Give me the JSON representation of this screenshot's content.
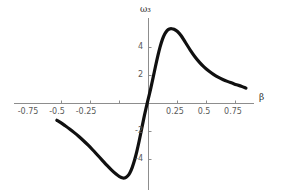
{
  "chart_data": {
    "type": "line",
    "title": "",
    "xlabel": "β",
    "ylabel": "ω3",
    "ylabel_display": "ω₃",
    "xlim": [
      -0.875,
      0.9
    ],
    "ylim": [
      -6.0,
      6.2
    ],
    "grid": false,
    "legend": null,
    "xticks": [
      -0.75,
      -0.5,
      -0.25,
      0.25,
      0.5,
      0.75
    ],
    "xticklabels": [
      "-0.75",
      "-0.5",
      "-0.25",
      "0.25",
      "0.5",
      "0.75"
    ],
    "yticks": [
      4,
      2,
      -2,
      -4
    ],
    "yticklabels": [
      "4",
      "2",
      "-2",
      "-4"
    ],
    "series": [
      {
        "name": "ω3(β)",
        "color": "#101010",
        "linewidth": 3.2,
        "x": [
          -0.79,
          -0.76,
          -0.72,
          -0.68,
          -0.64,
          -0.6,
          -0.56,
          -0.52,
          -0.48,
          -0.44,
          -0.4,
          -0.36,
          -0.32,
          -0.28,
          -0.25,
          -0.22,
          -0.2,
          -0.18,
          -0.16,
          -0.14,
          -0.12,
          -0.1,
          -0.08,
          -0.06,
          -0.04,
          -0.02,
          0.0,
          0.02,
          0.04,
          0.06,
          0.08,
          0.1,
          0.12,
          0.14,
          0.16,
          0.18,
          0.2,
          0.22,
          0.25,
          0.28,
          0.32,
          0.36,
          0.4,
          0.44,
          0.48,
          0.52,
          0.56,
          0.6,
          0.64,
          0.68,
          0.72,
          0.76,
          0.8,
          0.84
        ],
        "y": [
          -1.2,
          -1.35,
          -1.58,
          -1.82,
          -2.08,
          -2.36,
          -2.66,
          -2.98,
          -3.32,
          -3.68,
          -4.04,
          -4.4,
          -4.74,
          -5.04,
          -5.22,
          -5.32,
          -5.3,
          -5.18,
          -4.94,
          -4.56,
          -4.04,
          -3.4,
          -2.66,
          -1.86,
          -1.04,
          -0.3,
          0.4,
          1.1,
          1.86,
          2.64,
          3.38,
          4.04,
          4.58,
          4.96,
          5.2,
          5.32,
          5.34,
          5.3,
          5.14,
          4.86,
          4.34,
          3.82,
          3.34,
          2.94,
          2.6,
          2.32,
          2.08,
          1.88,
          1.72,
          1.58,
          1.46,
          1.34,
          1.24,
          1.1
        ]
      }
    ],
    "annotations": []
  },
  "figure": {
    "background": "#ffffff",
    "axis_color": "#8d8d8d",
    "tick_label_color": "#5a5a5a",
    "axis_title_color": "#2b2b2b",
    "curve_color": "#101010"
  },
  "labels": {
    "x_axis_title": "β",
    "y_axis_title": "ω₃",
    "x_tick_0": "-0.75",
    "x_tick_1": "-0.5",
    "x_tick_2": "-0.25",
    "x_tick_3": "0.25",
    "x_tick_4": "0.5",
    "x_tick_5": "0.75",
    "y_tick_0": "4",
    "y_tick_1": "2",
    "y_tick_2": "-2",
    "y_tick_3": "-4"
  }
}
